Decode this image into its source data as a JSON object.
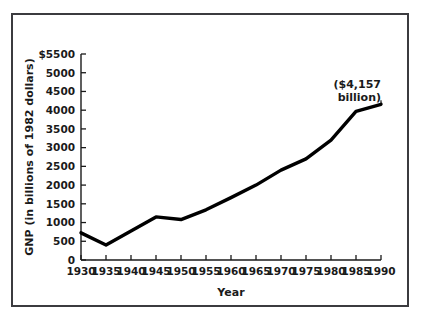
{
  "figure": {
    "border_color": "#3b3b3f",
    "background_color": "#ffffff",
    "line_color": "#000000"
  },
  "annotation": {
    "line1": "($4,157",
    "line2": "billion)"
  },
  "chart_data": {
    "type": "line",
    "title": "",
    "xlabel": "Year",
    "ylabel": "GNP (in billions of 1982 dollars)",
    "xlim": [
      1930,
      1990
    ],
    "ylim": [
      0,
      5500
    ],
    "grid": false,
    "legend": "none",
    "x_tick_labels": [
      "1930",
      "1935",
      "1940",
      "1945",
      "1950",
      "1955",
      "1960",
      "1965",
      "1970",
      "1975",
      "1980",
      "1985",
      "1990"
    ],
    "y_tick_labels": [
      "$5500",
      "5000",
      "4500",
      "4000",
      "3500",
      "3000",
      "2500",
      "2000",
      "1500",
      "1000",
      "500",
      "0"
    ],
    "x": [
      1930,
      1935,
      1940,
      1945,
      1950,
      1955,
      1960,
      1965,
      1970,
      1975,
      1980,
      1985,
      1990
    ],
    "values": [
      725,
      400,
      775,
      1150,
      1080,
      1340,
      1665,
      2000,
      2400,
      2700,
      3200,
      3970,
      4157
    ],
    "annotations": [
      {
        "x": 1990,
        "y": 4157,
        "text": "($4,157 billion)"
      }
    ]
  }
}
